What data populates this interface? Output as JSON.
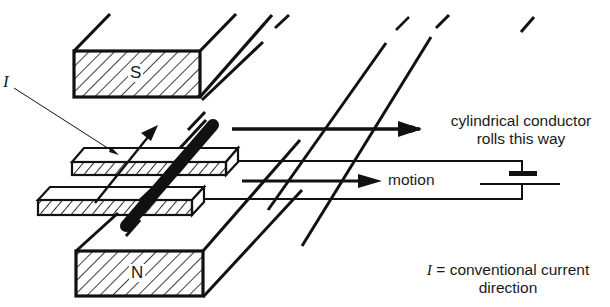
{
  "diagram": {
    "type": "physics-apparatus",
    "magnets": {
      "top": {
        "label": "S"
      },
      "bottom": {
        "label": "N"
      }
    },
    "labels": {
      "current_symbol": "I",
      "conductor_direction_line1": "cylindrical conductor",
      "conductor_direction_line2": "rolls this way",
      "motion": "motion",
      "legend_symbol": "I",
      "legend_eq": "=",
      "legend_line1": "conventional current",
      "legend_line2": "direction"
    },
    "components": [
      "south-pole magnet",
      "north-pole magnet",
      "upper rail",
      "lower rail",
      "cylindrical conductor",
      "battery",
      "connecting wires",
      "current arrow",
      "force arrow",
      "motion arrow"
    ],
    "colors": {
      "ink": "#111111",
      "background": "#ffffff"
    }
  }
}
